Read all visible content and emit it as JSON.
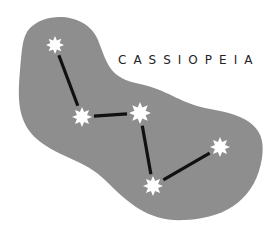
{
  "title": "CASSIOPEIA",
  "colors": {
    "background": "#ffffff",
    "region": "#8e8e8e",
    "lines": "#111111",
    "stars": "#ffffff",
    "text": "#222222"
  },
  "stars": [
    {
      "id": "star-1",
      "name": "star",
      "points": 8
    },
    {
      "id": "star-2",
      "name": "star",
      "points": 8
    },
    {
      "id": "star-3",
      "name": "star",
      "points": 8
    },
    {
      "id": "star-4",
      "name": "star",
      "points": 8
    },
    {
      "id": "star-5",
      "name": "star",
      "points": 8
    }
  ],
  "connections": [
    [
      "star-1",
      "star-2"
    ],
    [
      "star-2",
      "star-3"
    ],
    [
      "star-3",
      "star-4"
    ],
    [
      "star-4",
      "star-5"
    ]
  ]
}
